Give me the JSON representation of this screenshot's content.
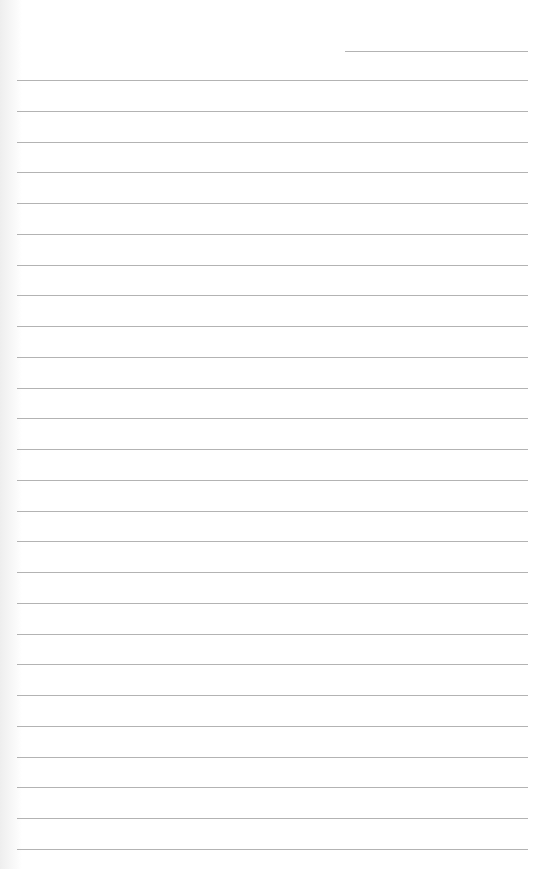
{
  "page": {
    "type": "lined-paper",
    "background_color": "#ffffff",
    "line_color": "#9a9a9a",
    "header_line": {
      "x1": 345,
      "x2": 528,
      "y": 51
    },
    "ruled_lines": {
      "count": 26,
      "first_y": 80,
      "spacing": 30.76,
      "x1": 17,
      "x2": 528
    }
  }
}
